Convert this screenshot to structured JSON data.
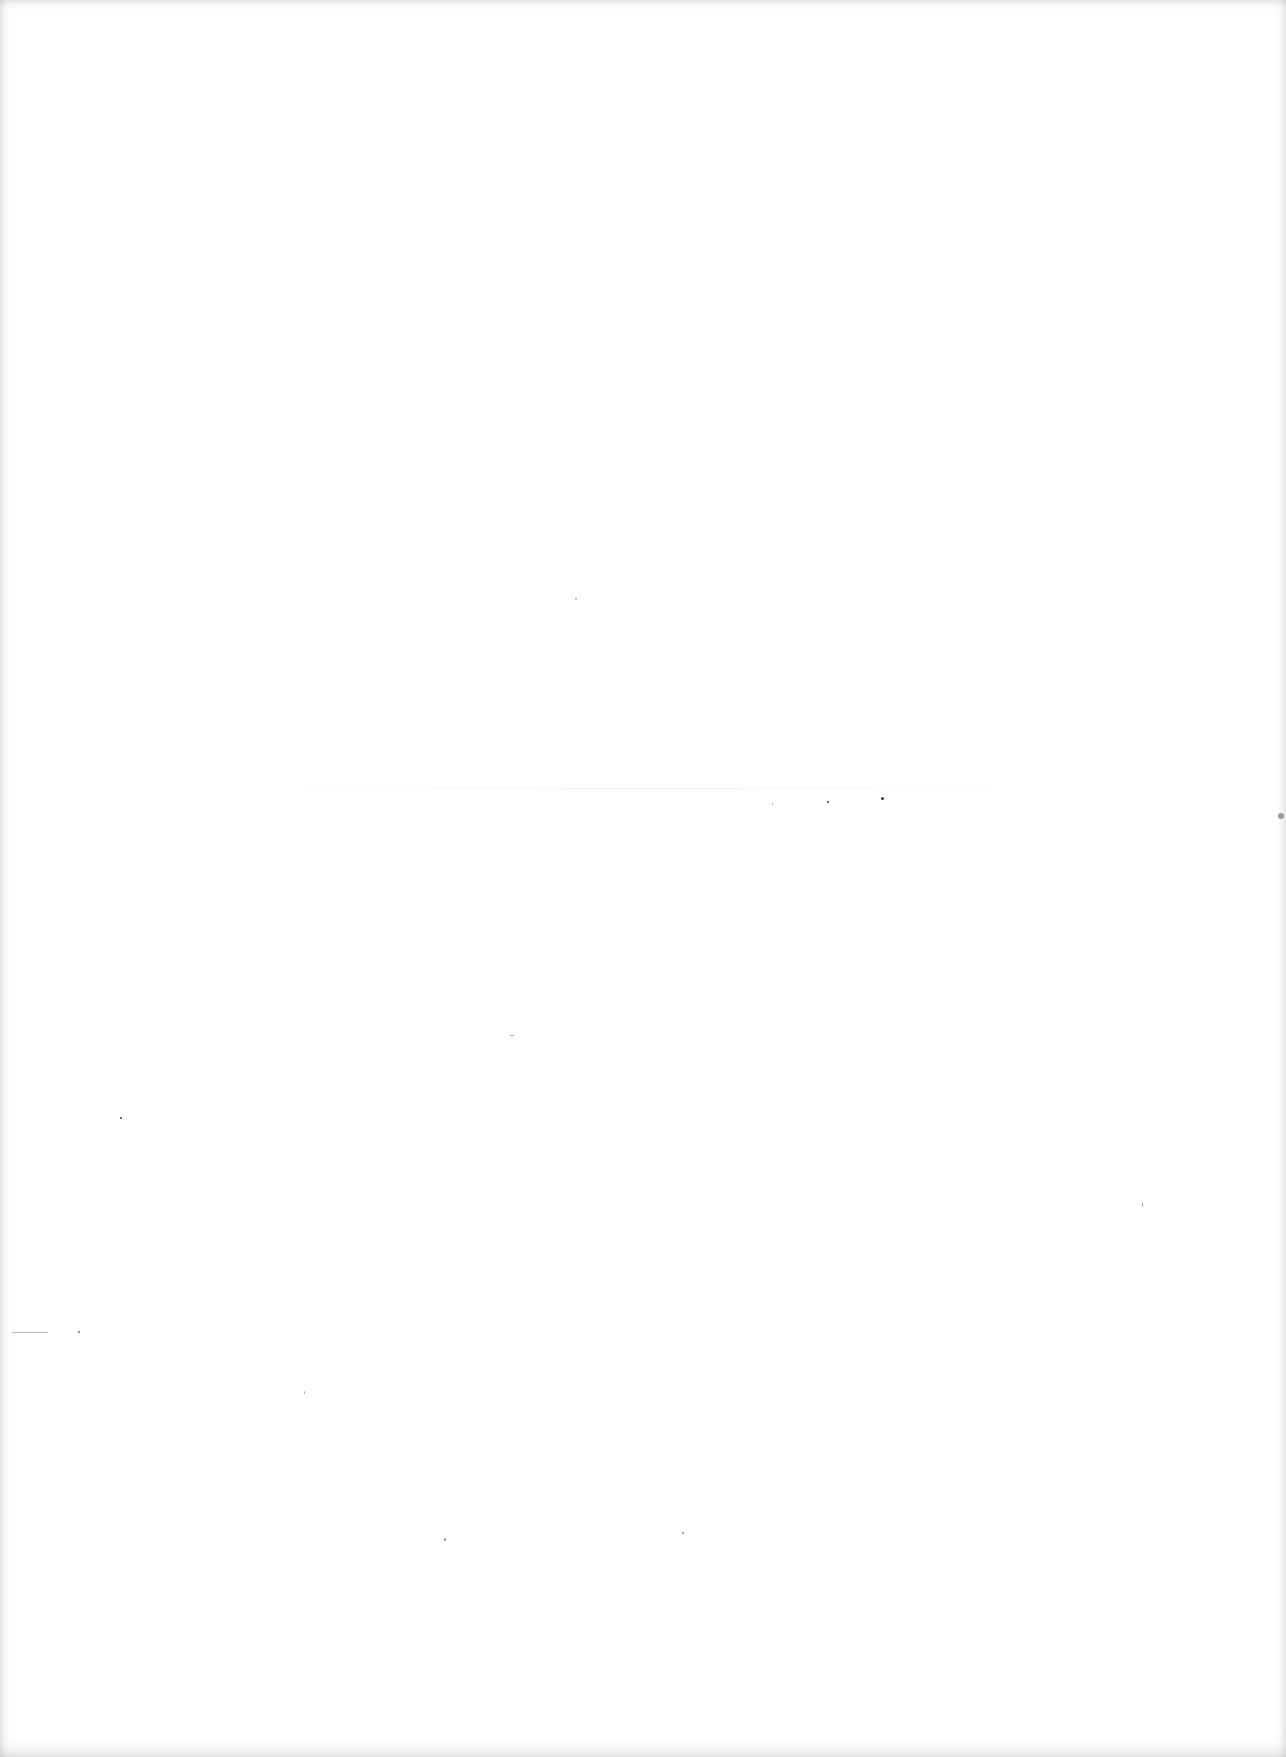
{
  "page": {
    "type": "blank-scanned-page",
    "background_color": "#ffffff"
  }
}
